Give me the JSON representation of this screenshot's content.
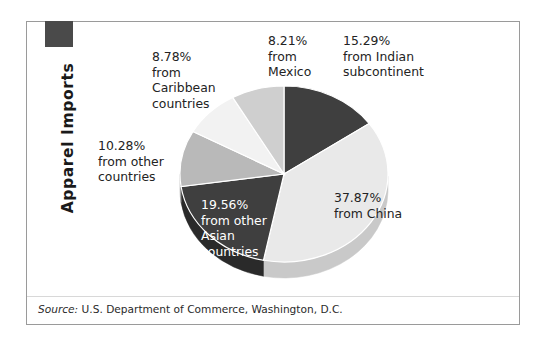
{
  "figure": {
    "title": "Apparel Imports",
    "title_marker_color": "#4a4a4a",
    "frame_color": "#9a9a9a",
    "background": "#ffffff",
    "source_label": "Source:",
    "source_text": " U.S. Department of Commerce, Washington, D.C."
  },
  "chart_data": {
    "type": "pie",
    "title": "Apparel Imports",
    "xlabel": "",
    "ylabel": "",
    "units": "percent",
    "total": 99.99,
    "legend_position": "none",
    "grid": false,
    "style": "3d-pie",
    "start_angle_deg": 0,
    "direction": "clockwise",
    "categories": [
      "Indian subcontinent",
      "China",
      "other Asian countries",
      "other countries",
      "Caribbean countries",
      "Mexico"
    ],
    "values": [
      15.29,
      37.87,
      19.56,
      10.28,
      8.78,
      8.21
    ],
    "colors": [
      "#3f3f3f",
      "#e9e9e9",
      "#3f3f3f",
      "#b9b9b9",
      "#f2f2f2",
      "#cfcfcf"
    ],
    "side_colors": [
      "#2a2a2a",
      "#c9c9c9",
      "#2a2a2a",
      "#9d9d9d",
      "#d4d4d4",
      "#b0b0b0"
    ],
    "labels": [
      {
        "category": "Indian subcontinent",
        "value": 15.29,
        "percent_text": "15.29%",
        "text": "15.29%\nfrom Indian\nsubcontinent",
        "placement": "outside",
        "text_color": "#232323"
      },
      {
        "category": "China",
        "value": 37.87,
        "percent_text": "37.87%",
        "text": "37.87%\nfrom China",
        "placement": "outside",
        "text_color": "#232323"
      },
      {
        "category": "other Asian countries",
        "value": 19.56,
        "percent_text": "19.56%",
        "text": "19.56%\nfrom other\nAsian\ncountries",
        "placement": "inside",
        "text_color": "#ffffff"
      },
      {
        "category": "other countries",
        "value": 10.28,
        "percent_text": "10.28%",
        "text": "10.28%\nfrom other\ncountries",
        "placement": "outside",
        "text_color": "#232323"
      },
      {
        "category": "Caribbean countries",
        "value": 8.78,
        "percent_text": "8.78%",
        "text": "8.78%\nfrom\nCaribbean\ncountries",
        "placement": "outside",
        "text_color": "#232323"
      },
      {
        "category": "Mexico",
        "value": 8.21,
        "percent_text": "8.21%",
        "text": "8.21%\nfrom\nMexico",
        "placement": "outside",
        "text_color": "#232323"
      }
    ]
  }
}
